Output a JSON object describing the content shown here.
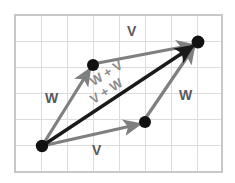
{
  "figure": {
    "colors": {
      "grid_line": "#d9d9d9",
      "frame": "#c8c8c8",
      "gray_vector": "#7f7f7f",
      "black_vector": "#1a1a1a",
      "dot": "#111111",
      "label_dark": "#595959",
      "label_faint": "#8c8c8c",
      "background": "#ffffff"
    },
    "grid": {
      "x": 15,
      "y": 15,
      "width": 207,
      "height": 157,
      "cell_size": 26,
      "columns": 8,
      "rows": 6,
      "show": true
    },
    "points": [
      {
        "name": "origin",
        "x": 42,
        "y": 146
      },
      {
        "name": "upper-node",
        "x": 93,
        "y": 65
      },
      {
        "name": "lower-node",
        "x": 145,
        "y": 122
      },
      {
        "name": "terminus",
        "x": 198,
        "y": 42
      }
    ],
    "vectors": [
      {
        "name": "w-left",
        "label": "W",
        "color": "gray",
        "from": "origin",
        "to": "upper-node"
      },
      {
        "name": "v-top",
        "label": "V",
        "color": "gray",
        "from": "upper-node",
        "to": "terminus"
      },
      {
        "name": "v-bottom",
        "label": "V",
        "color": "gray",
        "from": "origin",
        "to": "lower-node"
      },
      {
        "name": "w-right",
        "label": "W",
        "color": "gray",
        "from": "lower-node",
        "to": "terminus"
      },
      {
        "name": "sum-diagonal",
        "label": "W + V",
        "color": "black",
        "from": "origin",
        "to": "terminus"
      }
    ],
    "labels": [
      {
        "name": "label-v-top",
        "text": "V",
        "x": 133,
        "y": 32,
        "style": "big"
      },
      {
        "name": "label-w-left",
        "text": "W",
        "x": 53,
        "y": 99,
        "style": "big"
      },
      {
        "name": "label-w-right",
        "text": "W",
        "x": 185,
        "y": 96,
        "style": "big"
      },
      {
        "name": "label-v-bottom",
        "text": "V",
        "x": 98,
        "y": 151,
        "style": "big"
      },
      {
        "name": "label-sum-wv",
        "text": "W + V",
        "x": 96,
        "y": 83,
        "style": "mid"
      },
      {
        "name": "label-sum-vw",
        "text": "V + W",
        "x": 96,
        "y": 99,
        "style": "mid"
      }
    ]
  }
}
